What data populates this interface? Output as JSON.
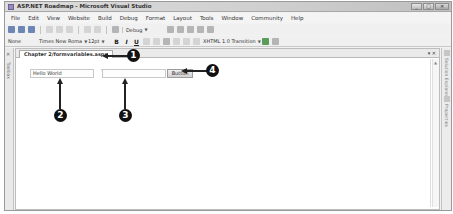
{
  "window": {
    "title": "ASP.NET Roadmap - Microsoft Visual Studio",
    "controls": {
      "minimize": "_",
      "maximize": "□",
      "close": "✕"
    }
  },
  "menubar": {
    "items": [
      "File",
      "Edit",
      "View",
      "Website",
      "Build",
      "Debug",
      "Format",
      "Layout",
      "Tools",
      "Window",
      "Community",
      "Help"
    ]
  },
  "toolbar1": {
    "config_dropdown": "Debug"
  },
  "toolbar2": {
    "block_format": "None",
    "font_name": "Times New Roma",
    "font_size": "12pt",
    "bold": "B",
    "italic": "I",
    "underline": "U",
    "target_schema": "XHTML 1.0 Transition"
  },
  "toolbox": {
    "label": "Toolbox"
  },
  "right_panels": {
    "solution_explorer": "Solution Explorer",
    "properties": "Properties"
  },
  "document": {
    "tab_label": "Chapter 2/formvariables.aspx",
    "tab_controls": "▾ ✕",
    "design": {
      "textbox1_value": "Hello World",
      "textbox2_value": "",
      "button_label": "Button"
    }
  },
  "callouts": [
    {
      "number": "1",
      "target": "document-tab"
    },
    {
      "number": "2",
      "target": "textbox-hello-world"
    },
    {
      "number": "3",
      "target": "textbox-empty"
    },
    {
      "number": "4",
      "target": "button-control"
    }
  ]
}
